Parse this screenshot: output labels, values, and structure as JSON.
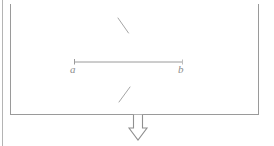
{
  "figure": {
    "kind": "line-diagram",
    "background_color": "#ffffff",
    "stroke_color": "#9a9a9a",
    "label_color": "#8d8d8d",
    "faint_stroke_color": "#bdbdbd",
    "canvas": {
      "width": 274,
      "height": 146
    },
    "margin_rule": {
      "name": "page-margin-rule",
      "x": 2.5,
      "y1": 0,
      "y2": 146,
      "stroke_width": 1.1,
      "color": "#b4b4b4"
    },
    "frame": {
      "name": "open-top-rectangle",
      "left": 10.5,
      "right": 258.5,
      "top": 5,
      "bottom": 114.5,
      "stroke_width": 1.1,
      "top_open": true
    },
    "segment": {
      "name": "segment-ab",
      "x1": 74,
      "x2": 183,
      "y": 62,
      "stroke_width": 1.0,
      "endpoint_tick_height": 5,
      "labels": {
        "a": "a",
        "b": "b"
      }
    },
    "ticks": [
      {
        "name": "tick-upper-backslash",
        "x1": 118,
        "y1": 18,
        "x2": 128.5,
        "y2": 33,
        "stroke_width": 1.0
      },
      {
        "name": "tick-lower-slash",
        "x1": 130,
        "y1": 87,
        "x2": 119,
        "y2": 102,
        "stroke_width": 1.0
      }
    ],
    "arrow": {
      "name": "down-arrow",
      "style": "hollow-outline",
      "center_x": 138,
      "top_y": 114.5,
      "bottom_y": 140,
      "shaft_half_width": 4.5,
      "head_half_width": 9,
      "head_top_y": 128,
      "stroke_width": 1.1,
      "direction": "down"
    }
  }
}
